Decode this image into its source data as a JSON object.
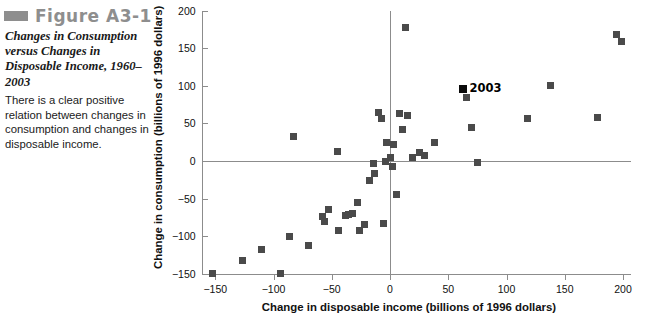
{
  "figure": {
    "number_label": "Figure A3-1",
    "swatch_icon": "figure-marker-bar",
    "title": "Changes in Consumption versus Changes in Disposable Income, 1960–2003",
    "body": "There is a clear positive relation between changes in consumption and changes in disposable income."
  },
  "chart_data": {
    "type": "scatter",
    "title": "",
    "xlabel": "Change in disposable income (billions of 1996 dollars)",
    "ylabel": "Change in consumption (billions of 1996 dollars)",
    "xlim": [
      -160,
      205
    ],
    "ylim": [
      -150,
      200
    ],
    "xticks": [
      -150,
      -100,
      -50,
      0,
      50,
      100,
      150,
      200
    ],
    "xticklabels": [
      "−150",
      "−100",
      "−50",
      "0",
      "50",
      "100",
      "150",
      "200"
    ],
    "yticks": [
      -150,
      -100,
      -50,
      0,
      50,
      100,
      150,
      200
    ],
    "yticklabels": [
      "−150",
      "−100",
      "−50",
      "0",
      "50",
      "100",
      "150",
      "200"
    ],
    "grid": false,
    "legend": null,
    "marker": "square",
    "marker_color": "#4a4a4a",
    "highlight_color": "#0b0b0b",
    "annotations": [
      {
        "text": "2003",
        "x": 63,
        "y": 96
      }
    ],
    "points": [
      {
        "x": -152,
        "y": -150
      },
      {
        "x": -127,
        "y": -133
      },
      {
        "x": -110,
        "y": -118
      },
      {
        "x": -94,
        "y": -150
      },
      {
        "x": -86,
        "y": -100
      },
      {
        "x": -83,
        "y": 33
      },
      {
        "x": -70,
        "y": -113
      },
      {
        "x": -58,
        "y": -74
      },
      {
        "x": -56,
        "y": -80
      },
      {
        "x": -53,
        "y": -64
      },
      {
        "x": -45,
        "y": 13
      },
      {
        "x": -44,
        "y": -93
      },
      {
        "x": -38,
        "y": -72
      },
      {
        "x": -36,
        "y": -71
      },
      {
        "x": -32,
        "y": -70
      },
      {
        "x": -28,
        "y": -55
      },
      {
        "x": -26,
        "y": -92
      },
      {
        "x": -22,
        "y": -85
      },
      {
        "x": -18,
        "y": -26
      },
      {
        "x": -14,
        "y": -3
      },
      {
        "x": -13,
        "y": -17
      },
      {
        "x": -10,
        "y": 64
      },
      {
        "x": -7,
        "y": 56
      },
      {
        "x": -6,
        "y": -83
      },
      {
        "x": -4,
        "y": -1
      },
      {
        "x": -3,
        "y": 25
      },
      {
        "x": 0,
        "y": 5
      },
      {
        "x": 2,
        "y": -7
      },
      {
        "x": 3,
        "y": 22
      },
      {
        "x": 6,
        "y": -44
      },
      {
        "x": 8,
        "y": 63
      },
      {
        "x": 11,
        "y": 42
      },
      {
        "x": 13,
        "y": 178
      },
      {
        "x": 15,
        "y": 60
      },
      {
        "x": 19,
        "y": 5
      },
      {
        "x": 25,
        "y": 11
      },
      {
        "x": 30,
        "y": 7
      },
      {
        "x": 38,
        "y": 24
      },
      {
        "x": 63,
        "y": 96
      },
      {
        "x": 66,
        "y": 85
      },
      {
        "x": 70,
        "y": 44
      },
      {
        "x": 75,
        "y": -2
      },
      {
        "x": 118,
        "y": 57
      },
      {
        "x": 138,
        "y": 101
      },
      {
        "x": 178,
        "y": 58
      },
      {
        "x": 194,
        "y": 168
      },
      {
        "x": 199,
        "y": 159
      }
    ]
  }
}
